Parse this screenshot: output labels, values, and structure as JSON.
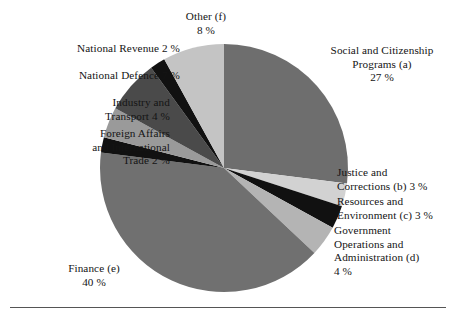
{
  "figure": {
    "background_color": "#ffffff",
    "text_color": "#141414",
    "rule_color": "#555555"
  },
  "chart_data": {
    "type": "pie",
    "title": "",
    "subtitle": "",
    "xlabel": "",
    "ylabel": "",
    "legend_position": "callout-labels",
    "grid": false,
    "units": "percent",
    "start_angle_deg": 0,
    "direction": "clockwise",
    "center": {
      "x": 224,
      "y": 168
    },
    "radius": 124,
    "categories": [
      "Social and Citizenship Programs (a)",
      "Justice and Corrections (b)",
      "Resources and Environment (c)",
      "Government Operations and Administration (d)",
      "Finance (e)",
      "Foreign Affairs and International Trade",
      "Industry and Transport",
      "National Defence",
      "National Revenue",
      "Other (f)"
    ],
    "values": [
      27,
      3,
      3,
      4,
      40,
      2,
      4,
      7,
      2,
      8
    ],
    "colors": [
      "#6e6e6e",
      "#d2d2d2",
      "#111111",
      "#b4b4b4",
      "#707070",
      "#111111",
      "#9a9a9a",
      "#4a4a4a",
      "#111111",
      "#c4c4c4"
    ],
    "slice_edge_color": "#ffffff",
    "slice_edge_width": 0
  },
  "labels": {
    "other": {
      "text": "Other (f)\n8 %",
      "name": "Other (f)",
      "value": "8 %",
      "align": "center"
    },
    "national_revenue": {
      "text": "National Revenue 2 %",
      "name": "National Revenue",
      "value": "2 %",
      "align": "right"
    },
    "national_defence": {
      "text": "National Defence 7 %",
      "name": "National Defence",
      "value": "7 %",
      "align": "right"
    },
    "industry_transport": {
      "text": "Industry and\nTransport 4 %",
      "name": "Industry and Transport",
      "value": "4 %",
      "align": "right"
    },
    "foreign_affairs": {
      "text": "Foreign Affairs\nand International\nTrade 2 %",
      "name": "Foreign Affairs and International Trade",
      "value": "2 %",
      "align": "right"
    },
    "finance": {
      "text": "Finance (e)\n40 %",
      "name": "Finance (e)",
      "value": "40 %",
      "align": "center"
    },
    "social_citizenship": {
      "text": "Social and Citizenship\nPrograms (a)\n27 %",
      "name": "Social and Citizenship Programs (a)",
      "value": "27 %",
      "align": "center"
    },
    "justice_corrections": {
      "text": "Justice and\nCorrections (b) 3 %",
      "name": "Justice and Corrections (b)",
      "value": "3 %",
      "align": "left"
    },
    "resources_environment": {
      "text": "Resources and\nEnvironment (c) 3 %",
      "name": "Resources and Environment (c)",
      "value": "3 %",
      "align": "left"
    },
    "government_operations": {
      "text": "Government\nOperations and\nAdministration (d)\n4 %",
      "name": "Government Operations and Administration (d)",
      "value": "4 %",
      "align": "left"
    }
  }
}
